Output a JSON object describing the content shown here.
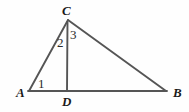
{
  "figure": {
    "kind": "geometry-diagram",
    "background_color": "#fefefe",
    "stroke_color": "#555555",
    "label_color": "#1a1a1a",
    "stroke_width": 1.8,
    "canvas": {
      "width": 189,
      "height": 112
    }
  },
  "vertices": {
    "A": {
      "label": "A",
      "x": 29,
      "y": 91
    },
    "B": {
      "label": "B",
      "x": 166,
      "y": 91
    },
    "C": {
      "label": "C",
      "x": 68,
      "y": 20
    },
    "D": {
      "label": "D",
      "x": 67,
      "y": 91
    }
  },
  "segments": [
    {
      "name": "AC",
      "from": "A",
      "to": "C"
    },
    {
      "name": "CB",
      "from": "C",
      "to": "B"
    },
    {
      "name": "AB",
      "from": "A",
      "to": "B"
    },
    {
      "name": "CD",
      "from": "C",
      "to": "D"
    }
  ],
  "angle_marks": [
    {
      "label": "1",
      "at_vertex": "A",
      "x": 38,
      "y": 77
    },
    {
      "label": "2",
      "at_vertex": "C",
      "x": 57,
      "y": 36
    },
    {
      "label": "3",
      "at_vertex": "C",
      "x": 70,
      "y": 28
    }
  ]
}
